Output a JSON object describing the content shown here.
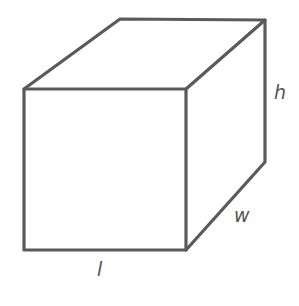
{
  "diagram": {
    "type": "rectangular-prism",
    "line_color": "#5a5a5a",
    "labels": {
      "height": "h",
      "width": "w",
      "length": "l"
    },
    "vertices": {
      "front_top_left": [
        24,
        89
      ],
      "front_top_right": [
        186,
        89
      ],
      "front_bottom_left": [
        24,
        250
      ],
      "front_bottom_right": [
        186,
        250
      ],
      "back_top_left": [
        120,
        19
      ],
      "back_top_right": [
        265,
        20
      ],
      "back_bottom_right": [
        265,
        162
      ]
    }
  }
}
